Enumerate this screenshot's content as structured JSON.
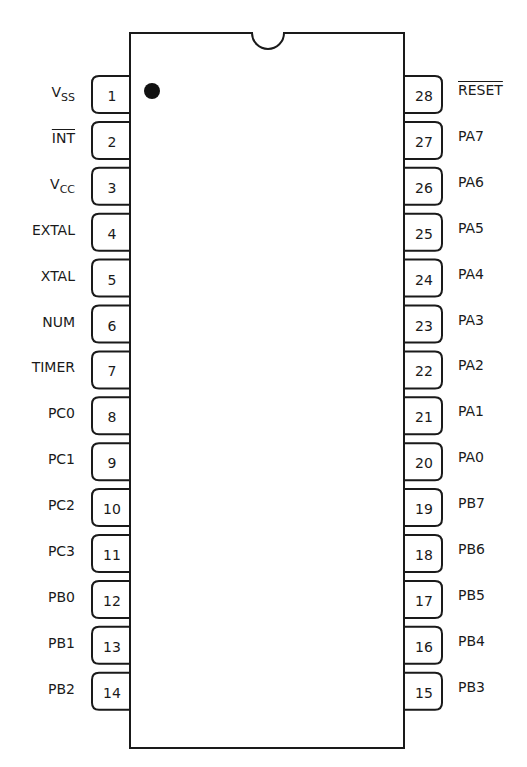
{
  "diagram": {
    "type": "DIP-28 pinout",
    "orientation_mark": "filled dot near pin 1",
    "colors": {
      "line": "#1a1a1a",
      "background": "#ffffff"
    },
    "left_pins": [
      {
        "number": "1",
        "label": "V",
        "sub": "SS",
        "overbar": false
      },
      {
        "number": "2",
        "label": "INT",
        "sub": "",
        "overbar": true
      },
      {
        "number": "3",
        "label": "V",
        "sub": "CC",
        "overbar": false
      },
      {
        "number": "4",
        "label": "EXTAL",
        "sub": "",
        "overbar": false
      },
      {
        "number": "5",
        "label": "XTAL",
        "sub": "",
        "overbar": false
      },
      {
        "number": "6",
        "label": "NUM",
        "sub": "",
        "overbar": false
      },
      {
        "number": "7",
        "label": "TIMER",
        "sub": "",
        "overbar": false
      },
      {
        "number": "8",
        "label": "PC0",
        "sub": "",
        "overbar": false
      },
      {
        "number": "9",
        "label": "PC1",
        "sub": "",
        "overbar": false
      },
      {
        "number": "10",
        "label": "PC2",
        "sub": "",
        "overbar": false
      },
      {
        "number": "11",
        "label": "PC3",
        "sub": "",
        "overbar": false
      },
      {
        "number": "12",
        "label": "PB0",
        "sub": "",
        "overbar": false
      },
      {
        "number": "13",
        "label": "PB1",
        "sub": "",
        "overbar": false
      },
      {
        "number": "14",
        "label": "PB2",
        "sub": "",
        "overbar": false
      }
    ],
    "right_pins": [
      {
        "number": "28",
        "label": "RESET",
        "overbar": true
      },
      {
        "number": "27",
        "label": "PA7",
        "overbar": false
      },
      {
        "number": "26",
        "label": "PA6",
        "overbar": false
      },
      {
        "number": "25",
        "label": "PA5",
        "overbar": false
      },
      {
        "number": "24",
        "label": "PA4",
        "overbar": false
      },
      {
        "number": "23",
        "label": "PA3",
        "overbar": false
      },
      {
        "number": "22",
        "label": "PA2",
        "overbar": false
      },
      {
        "number": "21",
        "label": "PA1",
        "overbar": false
      },
      {
        "number": "20",
        "label": "PA0",
        "overbar": false
      },
      {
        "number": "19",
        "label": "PB7",
        "overbar": false
      },
      {
        "number": "18",
        "label": "PB6",
        "overbar": false
      },
      {
        "number": "17",
        "label": "PB5",
        "overbar": false
      },
      {
        "number": "16",
        "label": "PB4",
        "overbar": false
      },
      {
        "number": "15",
        "label": "PB3",
        "overbar": false
      }
    ]
  }
}
